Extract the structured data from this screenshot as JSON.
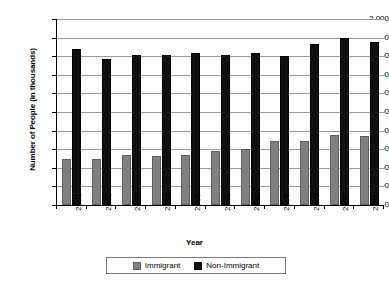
{
  "chart_data": {
    "type": "bar",
    "title": "",
    "xlabel": "Year",
    "ylabel": "Number of People (in thousands)",
    "categories": [
      "2001",
      "2002",
      "2003",
      "2004",
      "2005",
      "2006",
      "2007",
      "2008",
      "2009",
      "2010",
      "2011"
    ],
    "series": [
      {
        "name": "Immigrant",
        "color": "#808080",
        "values": [
          500,
          500,
          535,
          525,
          535,
          580,
          600,
          690,
          690,
          750,
          740
        ]
      },
      {
        "name": "Non-Immigrant",
        "color": "#101010",
        "values": [
          1680,
          1565,
          1615,
          1615,
          1635,
          1615,
          1635,
          1605,
          1735,
          1800,
          1750
        ]
      }
    ],
    "ylim": [
      0,
      2000
    ],
    "ytick_step": 200,
    "ytick_labels": [
      "2,000",
      "1,800",
      "1,600",
      "1,400",
      "1,200",
      "1,000",
      "800",
      "600",
      "400",
      "200",
      "0"
    ],
    "ytick_values": [
      2000,
      1800,
      1600,
      1400,
      1200,
      1000,
      800,
      600,
      400,
      200,
      0
    ],
    "grid": true,
    "grid_axis": "y",
    "legend_position": "bottom"
  },
  "legend": {
    "items": [
      {
        "label": "Immigrant",
        "swatch": "immigrant"
      },
      {
        "label": "Non-Immigrant",
        "swatch": "nonimmigrant"
      }
    ]
  },
  "axes": {
    "x_title": "Year",
    "y_title": "Number of People (in thousands)"
  },
  "colors": {
    "immigrant": "#808080",
    "non_immigrant": "#101010",
    "gridline": "#9a9a9a",
    "axis": "#000000",
    "background": "#ffffff"
  }
}
